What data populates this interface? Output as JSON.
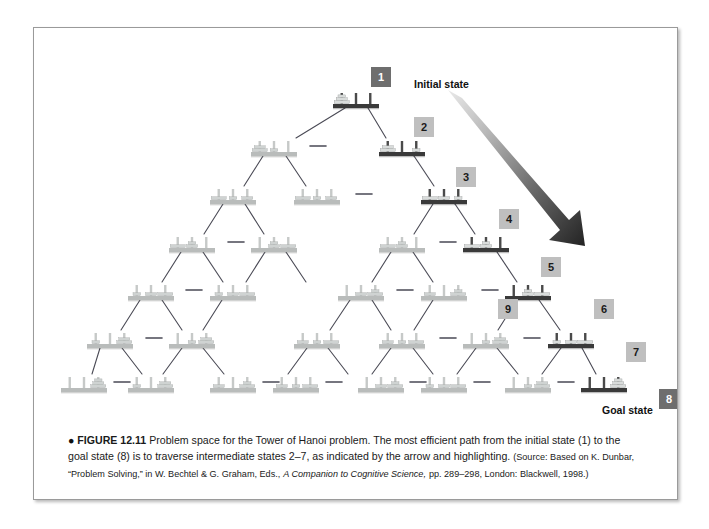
{
  "figure": {
    "number": "FIGURE 12.11",
    "bullet": "●",
    "title_text": "Problem space for the Tower of Hanoi problem. The most efficient path from the initial state (1) to the goal state (8) is to traverse intermediate states 2–7, as indicated by the arrow and highlighting.",
    "source_prefix": "(Source: Based on K. Dunbar, “Problem Solving,” in W. Bechtel & G. Graham, Eds.,",
    "source_italic": "A Companion to Cognitive Science,",
    "source_suffix": "pp. 289–298, London: Blackwell, 1998.)"
  },
  "annotations": {
    "initial_state_label": "Initial state",
    "goal_state_label": "Goal state",
    "arrow_name": "highlight-arrow"
  },
  "colors": {
    "chip_light_bg": "#bfbfbf",
    "chip_dark_bg": "#6e6e6e",
    "chip_light_text": "#1a1a1a",
    "chip_dark_text": "#ffffff",
    "node_normal_base": "#b9bcbb",
    "node_highlight_base": "#3a3a3a",
    "peg_normal": "#c6c9c8",
    "peg_highlight": "#4a4a4a",
    "disk_normal": "#cfd3d2",
    "disk_highlight": "#d9dcdb",
    "edge_line": "#4a4a55",
    "card_border": "#9a9a9a",
    "page_bg": "#ffffff"
  },
  "chart_data": {
    "type": "diagram",
    "title": "Problem space for the Tower of Hanoi problem",
    "labeled_states": [
      {
        "id": "1",
        "label": "1",
        "style": "dark",
        "role": "initial state",
        "x": 347,
        "y": 50,
        "pegs": [
          [
            3,
            2,
            1
          ],
          [],
          []
        ]
      },
      {
        "id": "2",
        "label": "2",
        "style": "light",
        "role": "path",
        "x": 390,
        "y": 100,
        "pegs": [
          [
            3,
            2
          ],
          [],
          [
            1
          ]
        ]
      },
      {
        "id": "3",
        "label": "3",
        "style": "light",
        "role": "path",
        "x": 432,
        "y": 150,
        "pegs": [
          [
            3
          ],
          [
            2
          ],
          [
            1
          ]
        ]
      },
      {
        "id": "4",
        "label": "4",
        "style": "light",
        "role": "path",
        "x": 475,
        "y": 192,
        "pegs": [
          [
            3
          ],
          [
            2,
            1
          ],
          []
        ]
      },
      {
        "id": "5",
        "label": "5",
        "style": "light",
        "role": "path",
        "x": 517,
        "y": 240,
        "pegs": [
          [],
          [
            2,
            1
          ],
          [
            3
          ]
        ]
      },
      {
        "id": "6",
        "label": "6",
        "style": "light",
        "role": "path",
        "x": 570,
        "y": 282,
        "pegs": [
          [
            1
          ],
          [
            2
          ],
          [
            3
          ]
        ]
      },
      {
        "id": "7",
        "label": "7",
        "style": "light",
        "role": "path",
        "x": 602,
        "y": 325,
        "pegs": [
          [
            1
          ],
          [],
          [
            3,
            2
          ]
        ]
      },
      {
        "id": "8",
        "label": "8",
        "style": "dark",
        "role": "goal state",
        "x": 635,
        "y": 372,
        "pegs": [
          [],
          [],
          [
            3,
            2,
            1
          ]
        ]
      },
      {
        "id": "9",
        "label": "9",
        "style": "light",
        "role": "alternate",
        "x": 474,
        "y": 282,
        "pegs": [
          [],
          [
            1
          ],
          [
            3,
            2
          ]
        ]
      }
    ],
    "rows": [
      1,
      2,
      3,
      4,
      5,
      6,
      7,
      8
    ],
    "row_node_counts": [
      1,
      2,
      3,
      4,
      5,
      6,
      7,
      8
    ],
    "total_nodes": 27,
    "disks": 3,
    "pegs": 3
  },
  "nodes": [
    {
      "row": 0,
      "col": 0,
      "cx": 322,
      "cy": 72,
      "hl": true,
      "pegs": [
        [
          3,
          2,
          1
        ],
        [],
        []
      ]
    },
    {
      "row": 1,
      "col": 0,
      "cx": 240,
      "cy": 120,
      "hl": false,
      "pegs": [
        [
          3,
          2
        ],
        [
          1
        ],
        []
      ]
    },
    {
      "row": 1,
      "col": 1,
      "cx": 368,
      "cy": 120,
      "hl": true,
      "pegs": [
        [
          3,
          2
        ],
        [],
        [
          1
        ]
      ]
    },
    {
      "row": 2,
      "col": 0,
      "cx": 199,
      "cy": 168,
      "hl": false,
      "pegs": [
        [
          3
        ],
        [
          1
        ],
        [
          2
        ]
      ]
    },
    {
      "row": 2,
      "col": 1,
      "cx": 283,
      "cy": 168,
      "hl": false,
      "pegs": [
        [
          3
        ],
        [
          1
        ],
        [
          2
        ]
      ]
    },
    {
      "row": 2,
      "col": 2,
      "cx": 410,
      "cy": 168,
      "hl": true,
      "pegs": [
        [
          3
        ],
        [
          2
        ],
        [
          1
        ]
      ]
    },
    {
      "row": 3,
      "col": 0,
      "cx": 158,
      "cy": 216,
      "hl": false,
      "pegs": [
        [
          3
        ],
        [
          2,
          1
        ],
        []
      ]
    },
    {
      "row": 3,
      "col": 1,
      "cx": 240,
      "cy": 216,
      "hl": false,
      "pegs": [
        [],
        [
          2,
          1
        ],
        [
          3
        ]
      ]
    },
    {
      "row": 3,
      "col": 2,
      "cx": 368,
      "cy": 216,
      "hl": false,
      "pegs": [
        [
          3
        ],
        [
          2,
          1
        ],
        []
      ]
    },
    {
      "row": 3,
      "col": 3,
      "cx": 452,
      "cy": 216,
      "hl": true,
      "pegs": [
        [
          3
        ],
        [
          2,
          1
        ],
        []
      ]
    },
    {
      "row": 4,
      "col": 0,
      "cx": 117,
      "cy": 264,
      "hl": false,
      "pegs": [
        [
          1
        ],
        [
          2
        ],
        [
          3
        ]
      ]
    },
    {
      "row": 4,
      "col": 1,
      "cx": 199,
      "cy": 264,
      "hl": false,
      "pegs": [
        [
          1
        ],
        [
          2
        ],
        [
          3
        ]
      ]
    },
    {
      "row": 4,
      "col": 2,
      "cx": 327,
      "cy": 264,
      "hl": false,
      "pegs": [
        [],
        [
          2
        ],
        [
          3,
          1
        ]
      ]
    },
    {
      "row": 4,
      "col": 3,
      "cx": 410,
      "cy": 264,
      "hl": false,
      "pegs": [
        [
          2
        ],
        [],
        [
          3,
          1
        ]
      ]
    },
    {
      "row": 4,
      "col": 4,
      "cx": 494,
      "cy": 264,
      "hl": true,
      "pegs": [
        [],
        [
          2,
          1
        ],
        [
          3
        ]
      ]
    },
    {
      "row": 5,
      "col": 0,
      "cx": 76,
      "cy": 312,
      "hl": false,
      "pegs": [
        [
          1
        ],
        [],
        [
          3,
          2
        ]
      ]
    },
    {
      "row": 5,
      "col": 1,
      "cx": 158,
      "cy": 312,
      "hl": false,
      "pegs": [
        [],
        [
          1
        ],
        [
          3,
          2
        ]
      ]
    },
    {
      "row": 5,
      "col": 2,
      "cx": 283,
      "cy": 312,
      "hl": false,
      "pegs": [
        [
          2
        ],
        [
          1
        ],
        [
          3
        ]
      ]
    },
    {
      "row": 5,
      "col": 3,
      "cx": 368,
      "cy": 312,
      "hl": false,
      "pegs": [
        [
          2
        ],
        [
          1
        ],
        [
          3
        ]
      ]
    },
    {
      "row": 5,
      "col": 4,
      "cx": 452,
      "cy": 312,
      "hl": false,
      "pegs": [
        [],
        [
          1
        ],
        [
          3,
          2
        ]
      ]
    },
    {
      "row": 5,
      "col": 5,
      "cx": 537,
      "cy": 312,
      "hl": true,
      "pegs": [
        [
          1
        ],
        [
          2
        ],
        [
          3
        ]
      ]
    },
    {
      "row": 6,
      "col": 0,
      "cx": 50,
      "cy": 356,
      "hl": false,
      "pegs": [
        [],
        [],
        [
          3,
          2,
          1
        ]
      ]
    },
    {
      "row": 6,
      "col": 1,
      "cx": 117,
      "cy": 356,
      "hl": false,
      "pegs": [
        [
          1
        ],
        [],
        [
          3,
          2
        ]
      ]
    },
    {
      "row": 6,
      "col": 2,
      "cx": 199,
      "cy": 356,
      "hl": false,
      "pegs": [
        [
          2
        ],
        [],
        [
          3,
          1
        ]
      ]
    },
    {
      "row": 6,
      "col": 3,
      "cx": 262,
      "cy": 356,
      "hl": false,
      "pegs": [
        [
          2
        ],
        [
          1
        ],
        [
          3
        ]
      ]
    },
    {
      "row": 6,
      "col": 4,
      "cx": 347,
      "cy": 356,
      "hl": false,
      "pegs": [
        [],
        [
          2
        ],
        [
          3,
          1
        ]
      ]
    },
    {
      "row": 6,
      "col": 5,
      "cx": 410,
      "cy": 356,
      "hl": false,
      "pegs": [
        [
          1
        ],
        [
          2
        ],
        [
          3
        ]
      ]
    },
    {
      "row": 6,
      "col": 6,
      "cx": 494,
      "cy": 356,
      "hl": false,
      "pegs": [
        [],
        [
          1
        ],
        [
          3,
          2
        ]
      ]
    },
    {
      "row": 6,
      "col": 7,
      "cx": 570,
      "cy": 356,
      "hl": true,
      "pegs": [
        [],
        [],
        [
          3,
          2,
          1
        ]
      ]
    }
  ]
}
